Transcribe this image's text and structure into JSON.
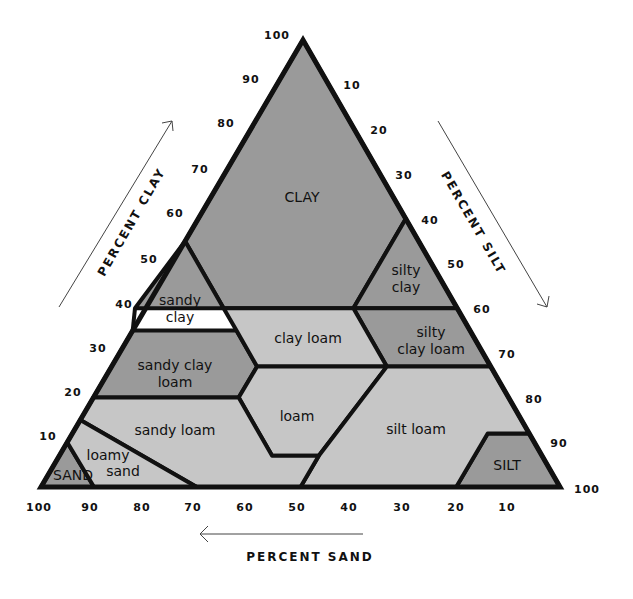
{
  "axes": {
    "clay": {
      "title": "PERCENT CLAY",
      "ticks": [
        "10",
        "20",
        "30",
        "40",
        "50",
        "60",
        "70",
        "80",
        "90",
        "100"
      ]
    },
    "silt": {
      "title": "PERCENT SILT",
      "ticks": [
        "10",
        "20",
        "30",
        "40",
        "50",
        "60",
        "70",
        "80",
        "90",
        "100"
      ]
    },
    "sand": {
      "title": "PERCENT SAND",
      "ticks": [
        "100",
        "90",
        "80",
        "70",
        "60",
        "50",
        "40",
        "30",
        "20",
        "10"
      ]
    }
  },
  "regions": {
    "clay": {
      "line1": "CLAY"
    },
    "silty_clay": {
      "line1": "silty",
      "line2": "clay"
    },
    "sandy_clay": {
      "line1": "sandy",
      "line2": "clay"
    },
    "clay_loam": {
      "line1": "clay loam"
    },
    "silty_clay_loam": {
      "line1": "silty",
      "line2": "clay loam"
    },
    "sandy_clay_loam": {
      "line1": "sandy clay",
      "line2": "loam"
    },
    "loam": {
      "line1": "loam"
    },
    "sandy_loam": {
      "line1": "sandy loam"
    },
    "silt_loam": {
      "line1": "silt loam"
    },
    "loamy_sand": {
      "line1": "loamy",
      "line2": "sand"
    },
    "sand": {
      "line1": "SAND"
    },
    "silt": {
      "line1": "SILT"
    }
  },
  "colors": {
    "dark_fill": "#9a9a9a",
    "light_fill": "#c6c6c6",
    "outline": "#111111"
  }
}
